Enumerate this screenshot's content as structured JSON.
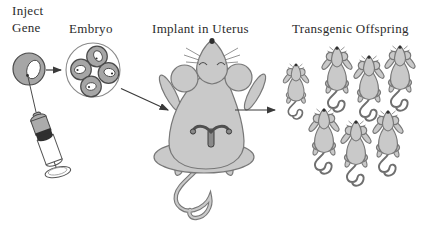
{
  "figure": {
    "type": "process-diagram",
    "steps": [
      {
        "id": "inject-gene",
        "label": "Inject Gene",
        "label_line1": "Inject",
        "label_line2": "Gene"
      },
      {
        "id": "embryo",
        "label": "Embryo"
      },
      {
        "id": "implant-in-uterus",
        "label": "Implant in Uterus"
      },
      {
        "id": "transgenic-offspring",
        "label": "Transgenic Offspring"
      }
    ],
    "embryo_cell_count": 4,
    "offspring_count": 7,
    "colors": {
      "background": "#ffffff",
      "mouse_fill": "#c9c9c9",
      "mouse_outline": "#787878",
      "cell_fill": "#a6a6a6",
      "cell_outline": "#4a4a4a",
      "dark_accent": "#2f2f2f",
      "arrow_color": "#3a3a3a",
      "text_color": "#2b2b2b"
    }
  }
}
